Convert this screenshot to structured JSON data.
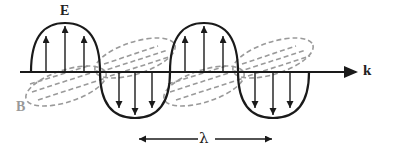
{
  "diagram": {
    "labels": {
      "electric_field": "E",
      "magnetic_field": "B",
      "propagation_direction": "k",
      "wavelength": "λ"
    },
    "colors": {
      "e_wave": "#1a1a1a",
      "b_wave": "#9a9a9a",
      "axis": "#1a1a1a"
    }
  }
}
